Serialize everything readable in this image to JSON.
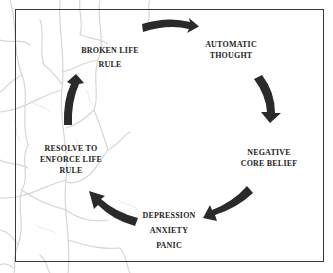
{
  "diagram": {
    "type": "cycle",
    "nodes": [
      {
        "id": "broken-life-rule",
        "lines": [
          "BROKEN LIFE",
          "RULE"
        ]
      },
      {
        "id": "automatic-thought",
        "lines": [
          "AUTOMATIC",
          "THOUGHT"
        ]
      },
      {
        "id": "negative-core-belief",
        "lines": [
          "NEGATIVE",
          "CORE BELIEF"
        ]
      },
      {
        "id": "depression-anxiety-panic",
        "lines": [
          "DEPRESSION",
          "ANXIETY",
          "PANIC"
        ]
      },
      {
        "id": "resolve-to-enforce-life-rule",
        "lines": [
          "RESOLVE TO",
          "ENFORCE LIFE",
          "RULE"
        ]
      }
    ],
    "edges": [
      {
        "from": "broken-life-rule",
        "to": "automatic-thought"
      },
      {
        "from": "automatic-thought",
        "to": "negative-core-belief"
      },
      {
        "from": "negative-core-belief",
        "to": "depression-anxiety-panic"
      },
      {
        "from": "depression-anxiety-panic",
        "to": "resolve-to-enforce-life-rule"
      },
      {
        "from": "resolve-to-enforce-life-rule",
        "to": "broken-life-rule"
      }
    ],
    "colors": {
      "arrow": "#2a2a2a",
      "text": "#1e1e1e",
      "frame": "#3a3a3a",
      "background_pattern": "#d9d9d9"
    }
  }
}
